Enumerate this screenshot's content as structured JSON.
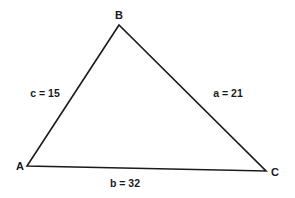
{
  "diagram": {
    "type": "triangle",
    "vertices": [
      {
        "id": "A",
        "label": "A"
      },
      {
        "id": "B",
        "label": "B"
      },
      {
        "id": "C",
        "label": "C"
      }
    ],
    "sides": [
      {
        "id": "a",
        "label": "a = 21",
        "between": [
          "B",
          "C"
        ]
      },
      {
        "id": "b",
        "label": "b = 32",
        "between": [
          "A",
          "C"
        ]
      },
      {
        "id": "c",
        "label": "c = 15",
        "between": [
          "A",
          "B"
        ]
      }
    ],
    "line_color": "#1a1a1a",
    "background": "#ffffff"
  }
}
